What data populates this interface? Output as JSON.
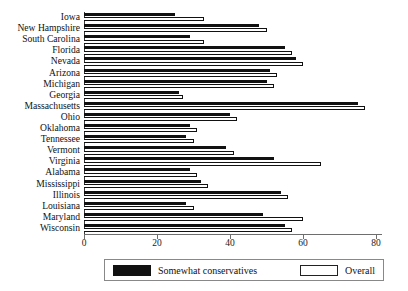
{
  "chart_data": {
    "type": "bar",
    "orientation": "horizontal",
    "title": "",
    "subtitle": "",
    "xlabel": "",
    "ylabel": "",
    "xlim": [
      0,
      80
    ],
    "ylim": null,
    "grid": false,
    "legend_position": "bottom",
    "xticks": [
      0,
      20,
      40,
      60,
      80
    ],
    "xtick_labels": [
      "0",
      "20",
      "40",
      "60",
      "80"
    ],
    "categories": [
      "Iowa",
      "New Hampshire",
      "South Carolina",
      "Florida",
      "Nevada",
      "Arizona",
      "Michigan",
      "Georgia",
      "Massachusetts",
      "Ohio",
      "Oklahoma",
      "Tennessee",
      "Vermont",
      "Virginia",
      "Alabama",
      "Mississippi",
      "Illinois",
      "Louisiana",
      "Maryland",
      "Wisconsin"
    ],
    "series": [
      {
        "name": "Somewhat conservatives",
        "color": "#111111",
        "style": "filled",
        "values": [
          25,
          48,
          29,
          55,
          58,
          51,
          50,
          26,
          75,
          40,
          29,
          28,
          39,
          52,
          29,
          32,
          54,
          28,
          49,
          55
        ]
      },
      {
        "name": "Overall",
        "color": "#ffffff",
        "style": "hollow",
        "values": [
          33,
          50,
          33,
          57,
          60,
          53,
          52,
          27,
          77,
          42,
          31,
          30,
          41,
          65,
          31,
          34,
          56,
          30,
          60,
          57
        ]
      }
    ]
  },
  "legend": {
    "entries": [
      {
        "label": "Somewhat conservatives",
        "style": "filled"
      },
      {
        "label": "Overall",
        "style": "hollow"
      }
    ]
  },
  "colors": {
    "somewhat_conservatives": "#111111",
    "overall": "#ffffff",
    "axis": "#3a3a3a",
    "background": "#ffffff"
  }
}
